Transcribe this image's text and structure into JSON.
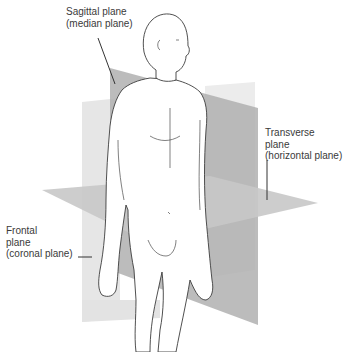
{
  "figure": {
    "planes": [
      {
        "id": "sagittal",
        "lines": [
          "Sagittal plane",
          "(median plane)"
        ],
        "color": "#a8a8a8"
      },
      {
        "id": "transverse",
        "lines": [
          "Transverse",
          "plane",
          "(horizontal plane)"
        ],
        "color": "#c9c9c9"
      },
      {
        "id": "frontal",
        "lines": [
          "Frontal",
          "plane",
          "(coronal plane)"
        ],
        "color": "#e4e4e4"
      }
    ]
  },
  "colors": {
    "background": "#ffffff",
    "text": "#3a3a3a",
    "leader": "#333333",
    "outline": "#3c3c3c"
  }
}
